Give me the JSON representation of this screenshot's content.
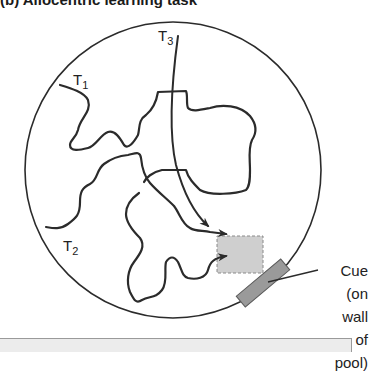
{
  "title": "(b) Allocentric learning task",
  "labels": {
    "t1": {
      "letter": "T",
      "sub": "1"
    },
    "t2": {
      "letter": "T",
      "sub": "2"
    },
    "t3": {
      "letter": "T",
      "sub": "3"
    }
  },
  "cue": {
    "line1": "Cue",
    "line2": "(on wall",
    "line3": "of pool)"
  },
  "colors": {
    "path": "#2b2b2b",
    "platform_fill": "#cfcfcf",
    "platform_border": "#8a8a8a",
    "cue_fill": "#9a9a9a",
    "footer_fill": "#ececec"
  }
}
